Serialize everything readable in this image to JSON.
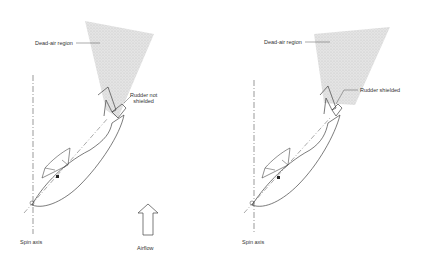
{
  "figures": [
    {
      "id": "left",
      "labels": {
        "dead_air": "Dead-air region",
        "rudder": "Rudder not\nshielded",
        "rudder_line1": "Rudder not",
        "rudder_line2": "shielded",
        "spin_axis": "Spin axis"
      }
    },
    {
      "id": "right",
      "labels": {
        "dead_air": "Dead-air region",
        "rudder": "Rudder shielded",
        "spin_axis": "Spin axis"
      }
    }
  ],
  "airflow": {
    "label": "Airflow",
    "icon": "up-arrow-icon"
  },
  "colors": {
    "shading": "#d8d8d8",
    "line": "#444444",
    "background": "#ffffff"
  }
}
